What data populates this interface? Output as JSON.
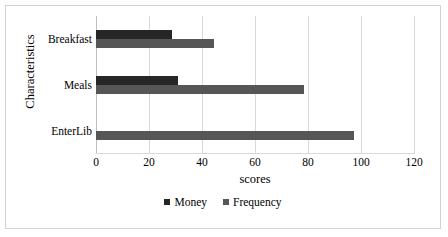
{
  "chart_data": {
    "type": "bar",
    "orientation": "horizontal",
    "title": "",
    "xlabel": "scores",
    "ylabel": "Characteristics",
    "categories": [
      "Breakfast",
      "Meals",
      "EnterLib"
    ],
    "series": [
      {
        "name": "Money",
        "color": "#262626",
        "values": [
          28.5,
          31,
          0
        ]
      },
      {
        "name": "Frequency",
        "color": "#565656",
        "values": [
          44.5,
          78.5,
          97.5
        ]
      }
    ],
    "xlim": [
      0,
      120
    ],
    "xticks": [
      0,
      20,
      40,
      60,
      80,
      100,
      120
    ],
    "xtick_labels": [
      "0",
      "20",
      "40",
      "60",
      "80",
      "100",
      "120"
    ],
    "grid": "vertical",
    "legend_position": "bottom"
  },
  "axes": {
    "y_title": "Characteristics",
    "x_title": "scores"
  },
  "legend": {
    "items": [
      {
        "label": "Money",
        "color": "#262626"
      },
      {
        "label": "Frequency",
        "color": "#565656"
      }
    ]
  },
  "colors": {
    "money": "#262626",
    "frequency": "#565656",
    "gridline": "#d9d9d9",
    "frame": "#d2d2d2",
    "background": "#ffffff"
  }
}
